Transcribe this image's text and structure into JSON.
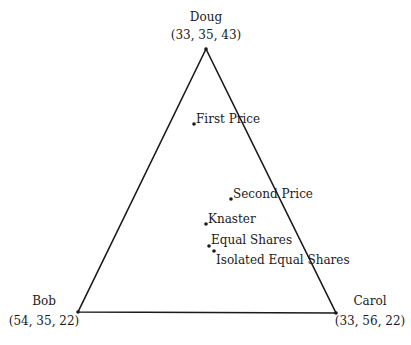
{
  "vertices": {
    "doug": {
      "name": "Doug",
      "coords": "(33, 35, 43)",
      "x": 206,
      "y": 49
    },
    "bob": {
      "name": "Bob",
      "coords": "(54, 35, 22)",
      "x": 78,
      "y": 312
    },
    "carol": {
      "name": "Carol",
      "coords": "(33, 56, 22)",
      "x": 336,
      "y": 313
    }
  },
  "points": [
    {
      "label": "First Price",
      "x": 194,
      "y": 124
    },
    {
      "label": "Second Price",
      "x": 231,
      "y": 199
    },
    {
      "label": "Knaster",
      "x": 206,
      "y": 224
    },
    {
      "label": "Equal Shares",
      "x": 209,
      "y": 246
    },
    {
      "label": "Isolated Equal Shares",
      "x": 214,
      "y": 251
    }
  ],
  "colors": {
    "line": "#1a1a1a",
    "point": "#1a1a1a"
  }
}
